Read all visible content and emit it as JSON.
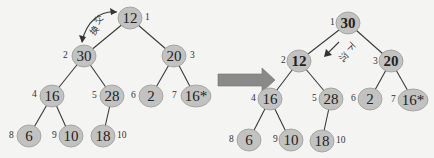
{
  "transition_arrow": {
    "icon": "right-arrow-icon",
    "color": "#8a8a8a"
  },
  "before": {
    "annotation": {
      "text_1": "交",
      "text_2": "换",
      "meaning": "swap"
    },
    "nodes": [
      {
        "index": "1",
        "value": "12"
      },
      {
        "index": "2",
        "value": "30"
      },
      {
        "index": "3",
        "value": "20"
      },
      {
        "index": "4",
        "value": "16"
      },
      {
        "index": "5",
        "value": "28"
      },
      {
        "index": "6",
        "value": "2"
      },
      {
        "index": "7",
        "value": "16*"
      },
      {
        "index": "8",
        "value": "6"
      },
      {
        "index": "9",
        "value": "10"
      },
      {
        "index": "10",
        "value": "18"
      }
    ]
  },
  "after": {
    "annotation": {
      "text_1": "下",
      "text_2": "沉",
      "meaning": "sink down"
    },
    "nodes": [
      {
        "index": "1",
        "value": "30"
      },
      {
        "index": "2",
        "value": "12"
      },
      {
        "index": "3",
        "value": "20"
      },
      {
        "index": "4",
        "value": "16"
      },
      {
        "index": "5",
        "value": "28"
      },
      {
        "index": "6",
        "value": "2"
      },
      {
        "index": "7",
        "value": "16*"
      },
      {
        "index": "8",
        "value": "6"
      },
      {
        "index": "9",
        "value": "10"
      },
      {
        "index": "10",
        "value": "18"
      }
    ]
  },
  "colors": {
    "node_fill": "#c2c2c0",
    "edge": "#3a3a3a",
    "background": "#f4f4f2"
  }
}
